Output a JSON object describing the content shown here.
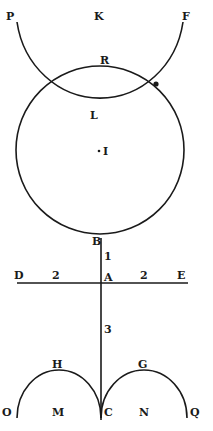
{
  "diagram": {
    "colors": {
      "ink": "#1a1a1a",
      "paper": "#ffffff"
    },
    "labels": {
      "P": "P",
      "K": "K",
      "F": "F",
      "R": "R",
      "L": "L",
      "I": "I",
      "B": "B",
      "D": "D",
      "A": "A",
      "E": "E",
      "H": "H",
      "G": "G",
      "O": "O",
      "M": "M",
      "C": "C",
      "N": "N",
      "Q": "Q"
    },
    "segment_marks": {
      "BA": "1",
      "DA": "2",
      "AE": "2",
      "AC": "3"
    }
  }
}
